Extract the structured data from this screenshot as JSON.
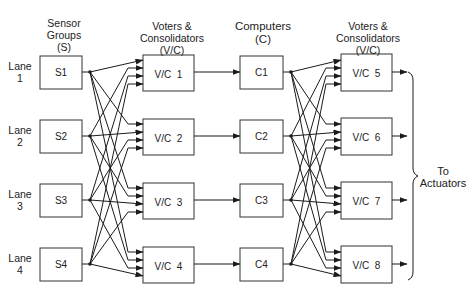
{
  "headers": {
    "sensor": [
      "Sensor",
      "Groups",
      "(S)"
    ],
    "voters_left": [
      "Voters  &",
      "Consolidators",
      "(V/C)"
    ],
    "computers": [
      "Computers",
      "(C)"
    ],
    "voters_right": [
      "Voters  &",
      "Consolidators",
      "(V/C)"
    ]
  },
  "lanes": [
    {
      "label": [
        "Lane",
        "1"
      ],
      "sensor": "S1",
      "vc_left": "V/C  1",
      "computer": "C1",
      "vc_right": "V/C  5"
    },
    {
      "label": [
        "Lane",
        "2"
      ],
      "sensor": "S2",
      "vc_left": "V/C  2",
      "computer": "C2",
      "vc_right": "V/C  6"
    },
    {
      "label": [
        "Lane",
        "3"
      ],
      "sensor": "S3",
      "vc_left": "V/C  3",
      "computer": "C3",
      "vc_right": "V/C  7"
    },
    {
      "label": [
        "Lane",
        "4"
      ],
      "sensor": "S4",
      "vc_left": "V/C  4",
      "computer": "C4",
      "vc_right": "V/C  8"
    }
  ],
  "output": [
    "To",
    "Actuators"
  ],
  "colors": {
    "line": "#1a1a1a",
    "background": "#ffffff"
  }
}
